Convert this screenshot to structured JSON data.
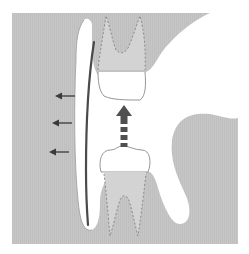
{
  "diagram": {
    "title": "",
    "colors": {
      "background": "#ffffff",
      "tissue": "#c4c4c4",
      "root_area": "#d2d2d2",
      "crown": "#ffffff",
      "outline": "#8a8a8a",
      "wire": "#4a4a4a",
      "arrow": "#3a3a3a",
      "dashed_arrow": "#505050"
    },
    "elements": [
      {
        "id": "upper-tooth",
        "label": "",
        "type": "tooth",
        "position": "top-center"
      },
      {
        "id": "lower-tooth",
        "label": "",
        "type": "tooth",
        "position": "bottom-center"
      },
      {
        "id": "eruption-arrow",
        "label": "",
        "type": "dashed-arrow",
        "direction": "up"
      },
      {
        "id": "appliance-wire",
        "label": "",
        "type": "line",
        "orientation": "vertical"
      },
      {
        "id": "lateral-arrow-1",
        "label": "",
        "type": "arrow",
        "direction": "left"
      },
      {
        "id": "lateral-arrow-2",
        "label": "",
        "type": "arrow",
        "direction": "left"
      },
      {
        "id": "lateral-arrow-3",
        "label": "",
        "type": "arrow",
        "direction": "left"
      }
    ]
  }
}
